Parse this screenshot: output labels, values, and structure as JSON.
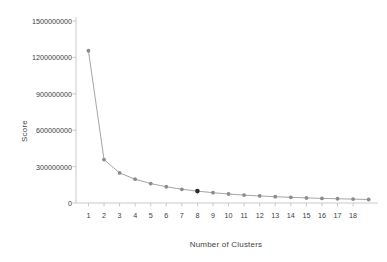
{
  "chart_data": {
    "type": "line",
    "title": "",
    "xlabel": "Number of Clusters",
    "ylabel": "Score",
    "x": [
      1,
      2,
      3,
      4,
      5,
      6,
      7,
      8,
      9,
      10,
      11,
      12,
      13,
      14,
      15,
      16,
      17,
      18,
      19
    ],
    "values": [
      1255000000,
      358000000,
      248000000,
      196000000,
      160000000,
      134000000,
      113000000,
      98000000,
      85000000,
      74000000,
      65000000,
      58000000,
      52000000,
      47000000,
      42000000,
      38000000,
      35000000,
      32000000,
      29000000
    ],
    "series": [
      {
        "name": "Score",
        "values": [
          1255000000,
          358000000,
          248000000,
          196000000,
          160000000,
          134000000,
          113000000,
          98000000,
          85000000,
          74000000,
          65000000,
          58000000,
          52000000,
          47000000,
          42000000,
          38000000,
          35000000,
          32000000,
          29000000
        ],
        "color": "#9a9a9a",
        "marker_color": "#8c8c8c"
      }
    ],
    "highlight": {
      "x": 8,
      "y": 98000000,
      "color": "#2b2b2b",
      "label": "elbow-point"
    },
    "xlim": [
      0.2,
      19.6
    ],
    "ylim": [
      0,
      1500000000
    ],
    "yticks": [
      0,
      300000000,
      600000000,
      900000000,
      1200000000,
      1500000000
    ],
    "ytick_labels": [
      "0",
      "300000000",
      "600000000",
      "900000000",
      "1200000000",
      "1500000000"
    ],
    "xticks": [
      1,
      2,
      3,
      4,
      5,
      6,
      7,
      8,
      9,
      10,
      11,
      12,
      13,
      14,
      15,
      16,
      17,
      18
    ],
    "xtick_labels": [
      "1",
      "2",
      "3",
      "4",
      "5",
      "6",
      "7",
      "8",
      "9",
      "10",
      "11",
      "12",
      "13",
      "14",
      "15",
      "16",
      "17",
      "18"
    ],
    "grid": false,
    "legend": null,
    "line_color": "#9a9a9a",
    "axis_color": "#bdbdbd",
    "background": "#ffffff"
  }
}
